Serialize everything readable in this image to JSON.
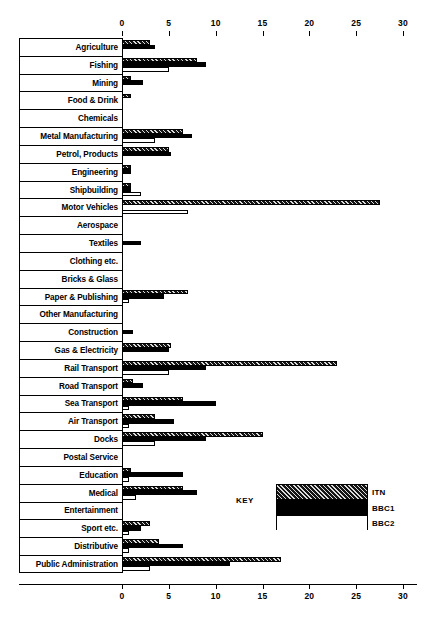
{
  "chart_data": {
    "type": "bar",
    "orientation": "horizontal",
    "title": "",
    "xlabel": "",
    "ylabel": "",
    "xlim": [
      0,
      30
    ],
    "xticks": [
      0,
      5,
      10,
      15,
      20,
      25,
      30
    ],
    "grid": false,
    "legend_position": "inside-bottom-right",
    "legend_title": "KEY",
    "categories": [
      "Agriculture",
      "Fishing",
      "Mining",
      "Food & Drink",
      "Chemicals",
      "Metal Manufacturing",
      "Petrol, Products",
      "Engineering",
      "Shipbuilding",
      "Motor Vehicles",
      "Aerospace",
      "Textiles",
      "Clothing etc.",
      "Bricks & Glass",
      "Paper & Publishing",
      "Other Manufacturing",
      "Construction",
      "Gas & Electricity",
      "Rail Transport",
      "Road Transport",
      "Sea Transport",
      "Air Transport",
      "Docks",
      "Postal Service",
      "Education",
      "Medical",
      "Entertainment",
      "Sport etc.",
      "Distributive",
      "Public Administration"
    ],
    "series": [
      {
        "name": "ITN",
        "fill": "hatched",
        "values": [
          3.0,
          8.0,
          1.0,
          1.0,
          0,
          6.5,
          5.0,
          1.0,
          1.0,
          27.5,
          0,
          0,
          0,
          0,
          7.0,
          0,
          0,
          5.2,
          23.0,
          1.2,
          6.5,
          3.5,
          15.0,
          0,
          1.0,
          6.5,
          0,
          3.0,
          4.0,
          17.0
        ]
      },
      {
        "name": "BBC1",
        "fill": "solid-black",
        "values": [
          3.5,
          9.0,
          2.2,
          0,
          0,
          7.5,
          5.2,
          1.0,
          1.0,
          0,
          0,
          2.0,
          0,
          0,
          4.5,
          0,
          1.2,
          5.0,
          9.0,
          2.2,
          10.0,
          5.5,
          9.0,
          0,
          6.5,
          8.0,
          0,
          2.0,
          6.5,
          11.5
        ]
      },
      {
        "name": "BBC2",
        "fill": "white",
        "values": [
          0,
          5.0,
          0,
          0,
          0,
          3.5,
          0,
          0,
          2.0,
          7.0,
          0,
          0,
          0,
          0,
          0.7,
          0,
          0,
          0,
          5.0,
          0,
          0.7,
          0.7,
          3.5,
          0,
          0.7,
          1.5,
          0,
          0.7,
          0.7,
          3.0
        ]
      }
    ]
  },
  "legend": {
    "key_label": "KEY",
    "entries": [
      {
        "label": "ITN"
      },
      {
        "label": "BBC1"
      },
      {
        "label": "BBC2"
      }
    ]
  }
}
